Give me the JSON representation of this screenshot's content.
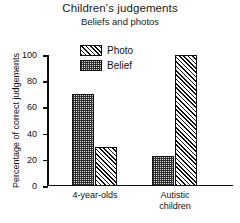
{
  "chart_data": {
    "type": "bar",
    "title": "Children's judgements",
    "subtitle": "Beliefs and photos",
    "xlabel": "",
    "ylabel": "Percentage of correct judgements",
    "ylim": [
      0,
      100
    ],
    "yticks": [
      "0",
      "20",
      "40",
      "60",
      "80",
      "100"
    ],
    "grid": false,
    "legend_position": "top-center",
    "categories": [
      "4-year-olds",
      "Autistic children"
    ],
    "category_lines": [
      [
        "4-year-olds"
      ],
      [
        "Autistic",
        "children"
      ]
    ],
    "series": [
      {
        "name": "Belief",
        "fill": "stipple",
        "values": [
          70,
          23
        ]
      },
      {
        "name": "Photo",
        "fill": "hatch",
        "values": [
          30,
          100
        ]
      }
    ],
    "bar_order_in_group": [
      "Belief",
      "Photo"
    ],
    "legend_order": [
      "Photo",
      "Belief"
    ],
    "colors": {
      "axis": "#111111",
      "stipple_fill": "#d6d6d6",
      "hatch_fill": "#ffffff",
      "background": "#ffffff"
    }
  },
  "legend": {
    "items": [
      {
        "label": "Photo",
        "fill": "hatch"
      },
      {
        "label": "Belief",
        "fill": "stipple"
      }
    ]
  }
}
